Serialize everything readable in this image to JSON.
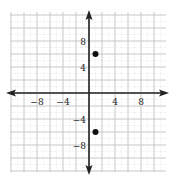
{
  "chart_data": {
    "type": "scatter",
    "title": "",
    "xlabel": "",
    "ylabel": "",
    "xlim": [
      -12,
      12
    ],
    "ylim": [
      -12,
      12
    ],
    "grid": true,
    "grid_major_step": 2,
    "grid_minor_step": 1,
    "x_ticks": [
      {
        "value": -8,
        "label": "−8"
      },
      {
        "value": -4,
        "label": "−4"
      },
      {
        "value": 4,
        "label": "4"
      },
      {
        "value": 8,
        "label": "8"
      }
    ],
    "y_ticks": [
      {
        "value": 8,
        "label": "8"
      },
      {
        "value": 4,
        "label": "4"
      },
      {
        "value": -4,
        "label": "−4"
      },
      {
        "value": -8,
        "label": "−8"
      }
    ],
    "points": [
      {
        "x": 1,
        "y": 6
      },
      {
        "x": 1,
        "y": -6
      }
    ],
    "colors": {
      "axis": "#222222",
      "grid_major": "#c8c8c8",
      "grid_minor": "#e2e2e2",
      "point": "#111111"
    }
  }
}
